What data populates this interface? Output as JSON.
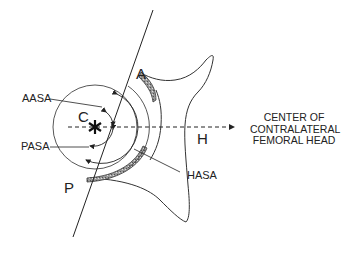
{
  "diagram": {
    "labels": {
      "point_a": "A",
      "point_p": "P",
      "point_c": "C",
      "point_h": "H",
      "aasa": "AASA",
      "pasa": "PASA",
      "hasa": "HASA"
    },
    "target": {
      "line1": "CENTER OF",
      "line2": "CONTRALATERAL",
      "line3": "FEMORAL HEAD"
    },
    "colors": {
      "stroke": "#222222",
      "cartilage_fill": "#8a8a8a",
      "background": "#ffffff"
    }
  }
}
